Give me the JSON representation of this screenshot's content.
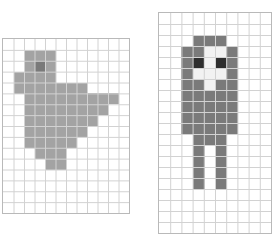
{
  "page": {
    "background_color": "#ffffff",
    "width": 279,
    "height": 245
  },
  "palette": {
    "grid_line": "#d2d2d2",
    "grid_border": "#b9b9b9",
    "empty": "#ffffff",
    "body_gray": "#a3a3a3",
    "dark_gray": "#7a7a7a",
    "eye_dark": "#2e2e2e",
    "face_white": "#f2f2f2"
  },
  "panels": [
    {
      "name": "left-grid-panel",
      "label": "Bird Sprite Grid",
      "x": 2,
      "y": 38,
      "width": 128,
      "height": 176,
      "columns": 12,
      "rows": 16,
      "sprite_name": "bird-sprite",
      "cells": [
        {
          "col": 2,
          "row": 1,
          "color": "#a3a3a3"
        },
        {
          "col": 3,
          "row": 1,
          "color": "#a3a3a3"
        },
        {
          "col": 4,
          "row": 1,
          "color": "#a3a3a3"
        },
        {
          "col": 2,
          "row": 2,
          "color": "#a3a3a3"
        },
        {
          "col": 3,
          "row": 2,
          "color": "#7a7a7a"
        },
        {
          "col": 4,
          "row": 2,
          "color": "#a3a3a3"
        },
        {
          "col": 1,
          "row": 3,
          "color": "#a3a3a3"
        },
        {
          "col": 2,
          "row": 3,
          "color": "#a3a3a3"
        },
        {
          "col": 3,
          "row": 3,
          "color": "#a3a3a3"
        },
        {
          "col": 4,
          "row": 3,
          "color": "#a3a3a3"
        },
        {
          "col": 1,
          "row": 4,
          "color": "#a3a3a3"
        },
        {
          "col": 2,
          "row": 4,
          "color": "#a3a3a3"
        },
        {
          "col": 3,
          "row": 4,
          "color": "#a3a3a3"
        },
        {
          "col": 4,
          "row": 4,
          "color": "#a3a3a3"
        },
        {
          "col": 5,
          "row": 4,
          "color": "#a3a3a3"
        },
        {
          "col": 6,
          "row": 4,
          "color": "#a3a3a3"
        },
        {
          "col": 7,
          "row": 4,
          "color": "#a3a3a3"
        },
        {
          "col": 2,
          "row": 5,
          "color": "#a3a3a3"
        },
        {
          "col": 3,
          "row": 5,
          "color": "#a3a3a3"
        },
        {
          "col": 4,
          "row": 5,
          "color": "#a3a3a3"
        },
        {
          "col": 5,
          "row": 5,
          "color": "#a3a3a3"
        },
        {
          "col": 6,
          "row": 5,
          "color": "#a3a3a3"
        },
        {
          "col": 7,
          "row": 5,
          "color": "#a3a3a3"
        },
        {
          "col": 8,
          "row": 5,
          "color": "#a3a3a3"
        },
        {
          "col": 9,
          "row": 5,
          "color": "#a3a3a3"
        },
        {
          "col": 10,
          "row": 5,
          "color": "#a3a3a3"
        },
        {
          "col": 2,
          "row": 6,
          "color": "#a3a3a3"
        },
        {
          "col": 3,
          "row": 6,
          "color": "#a3a3a3"
        },
        {
          "col": 4,
          "row": 6,
          "color": "#a3a3a3"
        },
        {
          "col": 5,
          "row": 6,
          "color": "#a3a3a3"
        },
        {
          "col": 6,
          "row": 6,
          "color": "#a3a3a3"
        },
        {
          "col": 7,
          "row": 6,
          "color": "#a3a3a3"
        },
        {
          "col": 8,
          "row": 6,
          "color": "#a3a3a3"
        },
        {
          "col": 9,
          "row": 6,
          "color": "#a3a3a3"
        },
        {
          "col": 2,
          "row": 7,
          "color": "#a3a3a3"
        },
        {
          "col": 3,
          "row": 7,
          "color": "#a3a3a3"
        },
        {
          "col": 4,
          "row": 7,
          "color": "#a3a3a3"
        },
        {
          "col": 5,
          "row": 7,
          "color": "#a3a3a3"
        },
        {
          "col": 6,
          "row": 7,
          "color": "#a3a3a3"
        },
        {
          "col": 7,
          "row": 7,
          "color": "#a3a3a3"
        },
        {
          "col": 8,
          "row": 7,
          "color": "#a3a3a3"
        },
        {
          "col": 2,
          "row": 8,
          "color": "#a3a3a3"
        },
        {
          "col": 3,
          "row": 8,
          "color": "#a3a3a3"
        },
        {
          "col": 4,
          "row": 8,
          "color": "#a3a3a3"
        },
        {
          "col": 5,
          "row": 8,
          "color": "#a3a3a3"
        },
        {
          "col": 6,
          "row": 8,
          "color": "#a3a3a3"
        },
        {
          "col": 7,
          "row": 8,
          "color": "#a3a3a3"
        },
        {
          "col": 2,
          "row": 9,
          "color": "#a3a3a3"
        },
        {
          "col": 3,
          "row": 9,
          "color": "#a3a3a3"
        },
        {
          "col": 4,
          "row": 9,
          "color": "#a3a3a3"
        },
        {
          "col": 5,
          "row": 9,
          "color": "#a3a3a3"
        },
        {
          "col": 6,
          "row": 9,
          "color": "#a3a3a3"
        },
        {
          "col": 3,
          "row": 10,
          "color": "#a3a3a3"
        },
        {
          "col": 4,
          "row": 10,
          "color": "#a3a3a3"
        },
        {
          "col": 5,
          "row": 10,
          "color": "#a3a3a3"
        },
        {
          "col": 4,
          "row": 11,
          "color": "#a3a3a3"
        },
        {
          "col": 5,
          "row": 11,
          "color": "#a3a3a3"
        }
      ]
    },
    {
      "name": "right-grid-panel",
      "label": "Character Sprite Grid",
      "x": 158,
      "y": 12,
      "width": 114,
      "height": 222,
      "columns": 10,
      "rows": 20,
      "sprite_name": "character-sprite",
      "cells": [
        {
          "col": 3,
          "row": 2,
          "color": "#7a7a7a"
        },
        {
          "col": 4,
          "row": 2,
          "color": "#7a7a7a"
        },
        {
          "col": 5,
          "row": 2,
          "color": "#7a7a7a"
        },
        {
          "col": 2,
          "row": 3,
          "color": "#7a7a7a"
        },
        {
          "col": 3,
          "row": 3,
          "color": "#7a7a7a"
        },
        {
          "col": 4,
          "row": 3,
          "color": "#f2f2f2"
        },
        {
          "col": 5,
          "row": 3,
          "color": "#f2f2f2"
        },
        {
          "col": 6,
          "row": 3,
          "color": "#7a7a7a"
        },
        {
          "col": 2,
          "row": 4,
          "color": "#7a7a7a"
        },
        {
          "col": 3,
          "row": 4,
          "color": "#2e2e2e"
        },
        {
          "col": 4,
          "row": 4,
          "color": "#f2f2f2"
        },
        {
          "col": 5,
          "row": 4,
          "color": "#2e2e2e"
        },
        {
          "col": 6,
          "row": 4,
          "color": "#7a7a7a"
        },
        {
          "col": 2,
          "row": 5,
          "color": "#7a7a7a"
        },
        {
          "col": 3,
          "row": 5,
          "color": "#f2f2f2"
        },
        {
          "col": 4,
          "row": 5,
          "color": "#f2f2f2"
        },
        {
          "col": 5,
          "row": 5,
          "color": "#f2f2f2"
        },
        {
          "col": 6,
          "row": 5,
          "color": "#7a7a7a"
        },
        {
          "col": 2,
          "row": 6,
          "color": "#7a7a7a"
        },
        {
          "col": 3,
          "row": 6,
          "color": "#7a7a7a"
        },
        {
          "col": 4,
          "row": 6,
          "color": "#f2f2f2"
        },
        {
          "col": 5,
          "row": 6,
          "color": "#7a7a7a"
        },
        {
          "col": 6,
          "row": 6,
          "color": "#7a7a7a"
        },
        {
          "col": 2,
          "row": 7,
          "color": "#7a7a7a"
        },
        {
          "col": 3,
          "row": 7,
          "color": "#7a7a7a"
        },
        {
          "col": 4,
          "row": 7,
          "color": "#7a7a7a"
        },
        {
          "col": 5,
          "row": 7,
          "color": "#7a7a7a"
        },
        {
          "col": 6,
          "row": 7,
          "color": "#7a7a7a"
        },
        {
          "col": 2,
          "row": 8,
          "color": "#7a7a7a"
        },
        {
          "col": 3,
          "row": 8,
          "color": "#7a7a7a"
        },
        {
          "col": 4,
          "row": 8,
          "color": "#7a7a7a"
        },
        {
          "col": 5,
          "row": 8,
          "color": "#7a7a7a"
        },
        {
          "col": 6,
          "row": 8,
          "color": "#7a7a7a"
        },
        {
          "col": 2,
          "row": 9,
          "color": "#7a7a7a"
        },
        {
          "col": 3,
          "row": 9,
          "color": "#7a7a7a"
        },
        {
          "col": 4,
          "row": 9,
          "color": "#7a7a7a"
        },
        {
          "col": 5,
          "row": 9,
          "color": "#7a7a7a"
        },
        {
          "col": 6,
          "row": 9,
          "color": "#7a7a7a"
        },
        {
          "col": 2,
          "row": 10,
          "color": "#7a7a7a"
        },
        {
          "col": 3,
          "row": 10,
          "color": "#7a7a7a"
        },
        {
          "col": 4,
          "row": 10,
          "color": "#7a7a7a"
        },
        {
          "col": 5,
          "row": 10,
          "color": "#7a7a7a"
        },
        {
          "col": 6,
          "row": 10,
          "color": "#7a7a7a"
        },
        {
          "col": 3,
          "row": 11,
          "color": "#7a7a7a"
        },
        {
          "col": 4,
          "row": 11,
          "color": "#7a7a7a"
        },
        {
          "col": 5,
          "row": 11,
          "color": "#7a7a7a"
        },
        {
          "col": 3,
          "row": 12,
          "color": "#7a7a7a"
        },
        {
          "col": 5,
          "row": 12,
          "color": "#7a7a7a"
        },
        {
          "col": 3,
          "row": 13,
          "color": "#7a7a7a"
        },
        {
          "col": 5,
          "row": 13,
          "color": "#7a7a7a"
        },
        {
          "col": 3,
          "row": 14,
          "color": "#7a7a7a"
        },
        {
          "col": 5,
          "row": 14,
          "color": "#7a7a7a"
        },
        {
          "col": 3,
          "row": 15,
          "color": "#7a7a7a"
        },
        {
          "col": 5,
          "row": 15,
          "color": "#7a7a7a"
        }
      ]
    }
  ]
}
